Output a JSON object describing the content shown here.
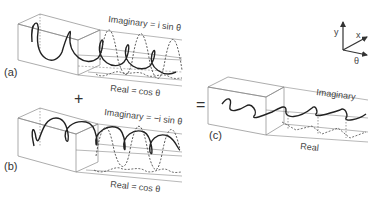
{
  "panels": {
    "a": {
      "label": "(a)",
      "imaginary_label": "Imaginary = i sin θ",
      "real_label": "Real = cos θ"
    },
    "b": {
      "label": "(b)",
      "imaginary_label": "Imaginary = −i sin θ",
      "real_label": "Real = cos θ"
    },
    "c": {
      "label": "(c)",
      "imaginary_label": "Imaginary",
      "real_label": "Real"
    }
  },
  "operators": {
    "plus": "+",
    "equals": "="
  },
  "axes": {
    "y": "y",
    "x": "x",
    "theta": "θ"
  }
}
